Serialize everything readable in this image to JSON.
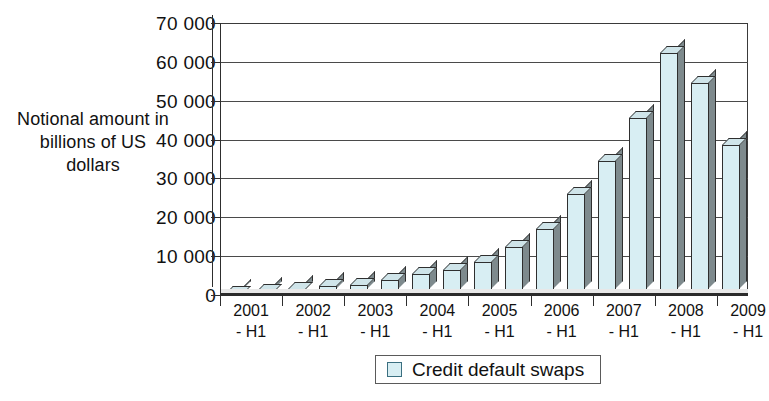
{
  "chart_data": {
    "type": "bar",
    "title": "",
    "xlabel": "",
    "ylabel": "Notional amount in billions of US dollars",
    "ylim": [
      0,
      70000
    ],
    "ytick_values": [
      0,
      10000,
      20000,
      30000,
      40000,
      50000,
      60000,
      70000
    ],
    "ytick_labels": [
      "0",
      "10 000",
      "20 000",
      "30 000",
      "40 000",
      "50 000",
      "60 000",
      "70 000"
    ],
    "grid": true,
    "legend_position": "bottom-center",
    "legend": [
      "Credit default swaps"
    ],
    "categories": [
      "2001 - H1",
      "2001 - H2",
      "2002 - H1",
      "2002 - H2",
      "2003 - H1",
      "2003 - H2",
      "2004 - H1",
      "2004 - H2",
      "2005 - H1",
      "2005 - H2",
      "2006 - H1",
      "2006 - H2",
      "2007 - H1",
      "2007 - H2",
      "2008 - H1",
      "2008 - H2",
      "2009 - H1"
    ],
    "xtick_labels": [
      {
        "line1": "2001",
        "line2": "- H1"
      },
      {
        "line1": "2002",
        "line2": "- H1"
      },
      {
        "line1": "2003",
        "line2": "- H1"
      },
      {
        "line1": "2004",
        "line2": "- H1"
      },
      {
        "line1": "2005",
        "line2": "- H1"
      },
      {
        "line1": "2006",
        "line2": "- H1"
      },
      {
        "line1": "2007",
        "line2": "- H1"
      },
      {
        "line1": "2008",
        "line2": "- H1"
      },
      {
        "line1": "2009",
        "line2": "- H1"
      }
    ],
    "series": [
      {
        "name": "Credit default swaps",
        "color": "#d8eef3",
        "values": [
          631,
          918,
          1563,
          2192,
          2688,
          3779,
          5442,
          6396,
          8422,
          12430,
          17096,
          26006,
          34423,
          45464,
          62173,
          54612,
          38564
        ]
      }
    ]
  },
  "y_axis_title_lines": [
    "Notional amount in",
    "billions of US",
    "dollars"
  ],
  "legend_items": [
    {
      "label": "Credit default swaps",
      "swatch_color": "#d8eef3"
    }
  ],
  "colors": {
    "bar_face": "#d8eef3",
    "bar_side": "#7e8a8d",
    "bar_top": "#cfe4e9",
    "axis": "#2e2e2e",
    "grid": "#4a4a4a",
    "text": "#111111",
    "background": "#ffffff"
  }
}
